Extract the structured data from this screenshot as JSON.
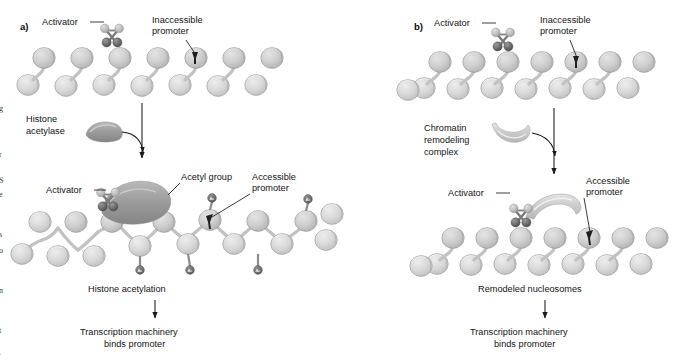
{
  "figure": {
    "type": "diagram",
    "background_color": "#ffffff",
    "colors": {
      "nucleosome_fill": "#c9c9c9",
      "nucleosome_fill_light": "#d6d6d6",
      "nucleosome_edge": "#8e8e8e",
      "activator_dark": "#5c5c5c",
      "activator_light": "#b4b4b4",
      "enzyme_dark": "#9a9a9a",
      "enzyme_light": "#cfcfcf",
      "acetyl_marker": "#6e6e6e",
      "promoter_mark": "#1f1f1f",
      "text": "#141414",
      "arrow": "#1a1a1a"
    }
  },
  "panels": [
    {
      "id": "a",
      "id_label": "a)",
      "mechanism": "histone acetylation",
      "top_stage": {
        "state": "condensed chromatin",
        "nucleosome_top_count": 7,
        "nucleosome_bottom_count": 7,
        "labels": [
          {
            "name": "activator",
            "text": "Activator"
          },
          {
            "name": "inaccessible-promoter",
            "text": "Inaccessible\npromoter",
            "line1": "Inaccessible",
            "line2": "promoter"
          }
        ]
      },
      "enzyme": {
        "name": "histone-acetylase",
        "line1": "Histone",
        "line2": "acetylase",
        "text": "Histone acetylase",
        "shape": "crescent"
      },
      "bottom_stage": {
        "state": "acetylated, loosened chromatin",
        "nucleosome_count": 16,
        "acetyl_group_count": 7,
        "acetyl_marker_text": "Ac",
        "labels": [
          {
            "name": "activator",
            "text": "Activator"
          },
          {
            "name": "acetyl-group",
            "text": "Acetyl group"
          },
          {
            "name": "accessible-promoter",
            "text": "Accessible\npromoter",
            "line1": "Accessible",
            "line2": "promoter"
          }
        ]
      },
      "outcome": {
        "step1": "Histone acetylation",
        "step2_line1": "Transcription machinery",
        "step2_line2": "binds promoter"
      }
    },
    {
      "id": "b",
      "id_label": "b)",
      "mechanism": "chromatin remodeling complex",
      "top_stage": {
        "state": "condensed chromatin",
        "nucleosome_top_count": 7,
        "nucleosome_bottom_count": 8,
        "labels": [
          {
            "name": "activator",
            "text": "Activator"
          },
          {
            "name": "inaccessible-promoter",
            "text": "Inaccessible\npromoter",
            "line1": "Inaccessible",
            "line2": "promoter"
          }
        ]
      },
      "enzyme": {
        "name": "chromatin-remodeling-complex",
        "line1": "Chromatin",
        "line2": "remodeling",
        "line3": "complex",
        "text": "Chromatin remodeling complex",
        "shape": "crescent"
      },
      "bottom_stage": {
        "state": "remodeled nucleosomes with exposed promoter",
        "nucleosome_top_count": 7,
        "nucleosome_bottom_count": 8,
        "labels": [
          {
            "name": "activator",
            "text": "Activator"
          },
          {
            "name": "accessible-promoter",
            "text": "Accessible\npromoter",
            "line1": "Accessible",
            "line2": "promoter"
          }
        ]
      },
      "outcome": {
        "step1": "Remodeled nucleosomes",
        "step2_line1": "Transcription machinery",
        "step2_line2": "binds promoter"
      }
    }
  ],
  "margin_fragments": [
    "g",
    "r",
    "S",
    "e",
    "s",
    "o",
    "n",
    "t",
    "."
  ]
}
